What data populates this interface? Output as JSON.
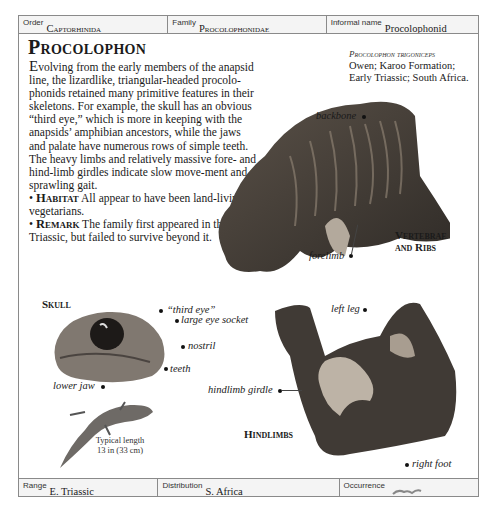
{
  "header": {
    "order": {
      "label": "Order",
      "value": "Captorhinida"
    },
    "family": {
      "label": "Family",
      "value": "Procolophonidae"
    },
    "informal_name": {
      "label": "Informal name",
      "value": "Procolophonid"
    }
  },
  "article": {
    "title": "Procolophon",
    "dropcap": "E",
    "intro": "volving from the early members of the anapsid line, the lizardlike, triangular-headed procolo-phonids retained many primitive features in their skeletons. For example, the skull has an obvious “third eye,” which is more in keeping with the anapsids’ amphibian ancestors, while the jaws and palate have numerous rows of simple teeth. The heavy limbs and relatively massive fore- and hind-limb girdles indicate slow move-ment and a sprawling gait.",
    "habitat_label": "Habitat",
    "habitat_text": "All appear to have been land-living vegetarians.",
    "remark_label": "Remark",
    "remark_text": "The family first appeared in the Early Triassic, but failed to survive beyond it."
  },
  "specimen": {
    "name": "Procolophon trigoniceps",
    "details_line1": "Owen; Karoo Formation;",
    "details_line2": "Early Triassic; South Africa."
  },
  "figures": {
    "vertebrae": {
      "caption_line1": "Vertebrae",
      "caption_line2": "and Ribs",
      "labels": {
        "backbone": "backbone",
        "forelimb": "forelimb"
      }
    },
    "skull": {
      "caption": "Skull",
      "labels": {
        "third_eye": "“third eye”",
        "eye_socket": "large eye socket",
        "nostril": "nostril",
        "teeth": "teeth",
        "lower_jaw": "lower jaw"
      }
    },
    "hindlimbs": {
      "caption": "Hindlimbs",
      "labels": {
        "left_leg": "left leg",
        "hindlimb_girdle": "hindlimb girdle",
        "right_foot": "right foot"
      }
    },
    "reconstruction": {
      "length_line1": "Typical length",
      "length_line2": "13 in (33 cm)"
    }
  },
  "footer": {
    "range": {
      "label": "Range",
      "value": "E. Triassic"
    },
    "distribution": {
      "label": "Distribution",
      "value": "S. Africa"
    },
    "occurrence": {
      "label": "Occurrence",
      "icon": "fossil-occurrence-icon"
    }
  }
}
